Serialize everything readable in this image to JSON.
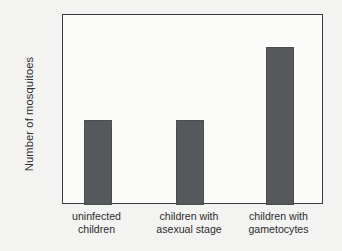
{
  "chart_data": {
    "type": "bar",
    "title": "",
    "subtitle": "",
    "xlabel": "",
    "ylabel": "Number of mosquitoes",
    "categories": [
      "uninfected children",
      "children with asexual stage",
      "children with gametocytes"
    ],
    "category_lines": [
      [
        "uninfected",
        "children"
      ],
      [
        "children with",
        "asexual stage"
      ],
      [
        "children with",
        "gametocytes"
      ]
    ],
    "values": [
      5.4,
      5.4,
      10.0
    ],
    "ylim": [
      0,
      12
    ],
    "ytick_values": [
      0,
      2,
      4,
      6,
      8,
      10,
      12
    ],
    "ytick_labels": [
      "0",
      "2",
      "4",
      "6",
      "8",
      "10",
      "12"
    ],
    "grid": false,
    "legend": null,
    "legend_position": "none",
    "bar_color": "#55595b",
    "axis_color": "#3a3a3a",
    "plot_background": "#fbfbfa",
    "figure_background": "#f3f3f2",
    "annotations": []
  }
}
